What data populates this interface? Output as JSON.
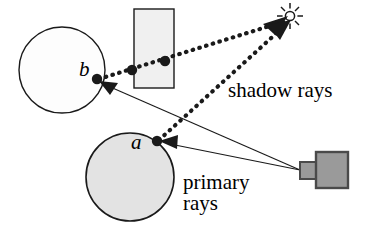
{
  "figure": {
    "background_color": "#ffffff",
    "stroke_color": "#1a1a1a",
    "labels": {
      "shadow_rays": "shadow rays",
      "primary_rays_line1": "primary",
      "primary_rays_line2": "rays",
      "point_b": "b",
      "point_a": "a"
    },
    "objects": [
      {
        "name": "upper-sphere",
        "type": "circle",
        "cx": 62,
        "cy": 70,
        "r": 43,
        "fill": "#fdfdfd",
        "stroke": "#1a1a1a"
      },
      {
        "name": "lower-sphere",
        "type": "circle",
        "cx": 130,
        "cy": 177,
        "r": 44,
        "fill": "#e3e3e3",
        "stroke": "#1a1a1a"
      },
      {
        "name": "occluder-box",
        "type": "rect",
        "x": 134,
        "y": 9,
        "width": 40,
        "height": 79,
        "fill": "#f0f0f0",
        "stroke": "#1a1a1a"
      },
      {
        "name": "light-source-sun",
        "type": "sun",
        "cx": 290,
        "cy": 16,
        "r": 5,
        "ray_count": 8,
        "stroke": "#1a1a1a"
      },
      {
        "name": "camera",
        "type": "camera",
        "body_x": 316,
        "body_y": 152,
        "body_width": 32,
        "body_height": 36,
        "lens_x": 300,
        "lens_y": 162,
        "lens_width": 18,
        "lens_height": 17,
        "fill": "#9a9a9a",
        "stroke": "#4a4a4a"
      }
    ],
    "intersection_points": [
      {
        "name": "point-b-dot",
        "cx": 97,
        "cy": 79,
        "r": 5.2
      },
      {
        "name": "point-a-dot",
        "cx": 157,
        "cy": 141,
        "r": 5.2
      },
      {
        "name": "occluder-entry-dot",
        "cx": 132,
        "cy": 70,
        "r": 5.2
      },
      {
        "name": "occluder-exit-dot",
        "cx": 165,
        "cy": 61,
        "r": 5.2
      }
    ],
    "primary_rays": [
      {
        "name": "primary-ray-to-b",
        "x1": 300,
        "y1": 170,
        "x2": 102,
        "y2": 83
      },
      {
        "name": "primary-ray-to-a",
        "x1": 300,
        "y1": 170,
        "x2": 163,
        "y2": 143
      }
    ],
    "shadow_rays": [
      {
        "name": "shadow-ray-from-b",
        "x1": 97,
        "y1": 79,
        "x2": 282,
        "y2": 22,
        "blocked": true
      },
      {
        "name": "shadow-ray-from-a",
        "x1": 157,
        "y1": 141,
        "x2": 284,
        "y2": 26,
        "blocked": false
      }
    ]
  }
}
